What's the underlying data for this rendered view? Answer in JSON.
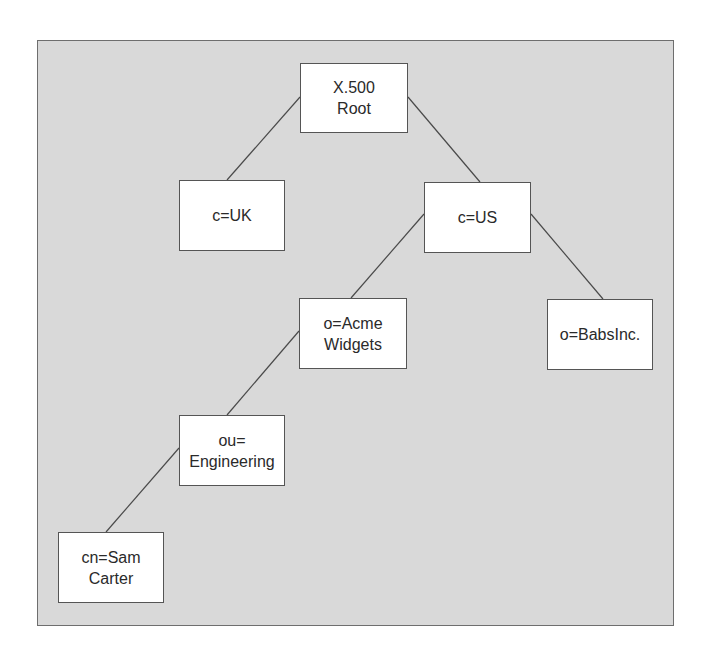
{
  "diagram": {
    "colors": {
      "background": "#d9d9d9",
      "node_fill": "#ffffff",
      "node_border": "#555555",
      "line": "#4a4a4a",
      "text": "#2a2a2a"
    },
    "nodes": {
      "root": {
        "lines": [
          "X.500",
          "Root"
        ]
      },
      "uk": {
        "lines": [
          "c=UK"
        ]
      },
      "us": {
        "lines": [
          "c=US"
        ]
      },
      "acme": {
        "lines": [
          "o=Acme",
          "Widgets"
        ]
      },
      "babs": {
        "lines": [
          "o=BabsInc."
        ]
      },
      "engineering": {
        "lines": [
          "ou=",
          "Engineering"
        ]
      },
      "sam": {
        "lines": [
          "cn=Sam",
          "Carter"
        ]
      }
    },
    "edges": [
      {
        "from": "root",
        "to": "uk"
      },
      {
        "from": "root",
        "to": "us"
      },
      {
        "from": "us",
        "to": "acme"
      },
      {
        "from": "us",
        "to": "babs"
      },
      {
        "from": "acme",
        "to": "engineering"
      },
      {
        "from": "engineering",
        "to": "sam"
      }
    ]
  }
}
